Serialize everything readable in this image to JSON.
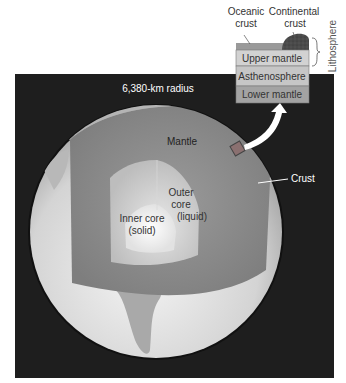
{
  "figure": {
    "radius_label": "6,380-km radius",
    "labels": {
      "mantle": "Mantle",
      "crust": "Crust",
      "outer_core_line1": "Outer",
      "outer_core_line2": "core",
      "outer_core_line3": "(liquid)",
      "inner_core_line1": "Inner core",
      "inner_core_line2": "(solid)"
    },
    "inset": {
      "oceanic_crust_line1": "Oceanic",
      "oceanic_crust_line2": "crust",
      "continental_crust_line1": "Continental",
      "continental_crust_line2": "crust",
      "lithosphere": "Lithosphere",
      "layers": [
        {
          "name": "Upper mantle"
        },
        {
          "name": "Asthenosphere"
        },
        {
          "name": "Lower mantle"
        }
      ]
    },
    "colors": {
      "background_panel": "#1e1e1e",
      "surface": "#d9d9d9",
      "mantle": "#8c8c8c",
      "outer_core": "#c8c8c8",
      "inner_core": "#f2f2f2",
      "crust_band": "#a8a8a8",
      "inset_crust": "#9a9a9a",
      "inset_upper_mantle": "#d2d2d2",
      "inset_asthenosphere": "#c6c6c6",
      "inset_lower_mantle": "#a3a3a3",
      "continental_crust": "#555555"
    }
  }
}
